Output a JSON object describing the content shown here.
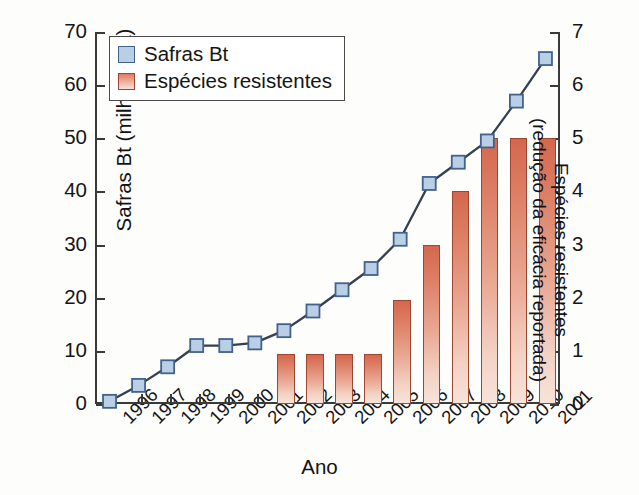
{
  "chart_data": {
    "type": "bar",
    "title": "",
    "xlabel": "Ano",
    "categories": [
      "1996",
      "1997",
      "1998",
      "1999",
      "2000",
      "2001",
      "2002",
      "2003",
      "2004",
      "2005",
      "2006",
      "2007",
      "2008",
      "2009",
      "2010",
      "2011"
    ],
    "series": [
      {
        "name": "Safras Bt",
        "type": "line",
        "axis": "left",
        "ylabel": "Safras Bt (milhões/ha)",
        "ylim": [
          0,
          70
        ],
        "yticks": [
          0,
          10,
          20,
          30,
          40,
          50,
          60,
          70
        ],
        "marker": "square",
        "color": "#b9cfe6",
        "values": [
          0.5,
          3.5,
          7.0,
          11.0,
          11.0,
          11.5,
          13.8,
          17.5,
          21.5,
          25.5,
          31.0,
          41.5,
          45.5,
          49.5,
          57.0,
          65.0
        ]
      },
      {
        "name": "Espécies resistentes",
        "type": "bar",
        "axis": "right",
        "ylabel": "Espécies resistentes (redução da eficácia reportada)",
        "ylim": [
          0,
          7
        ],
        "yticks": [
          0,
          1,
          2,
          3,
          4,
          5,
          6,
          7
        ],
        "color": "#d4674e",
        "values": [
          0,
          0,
          0,
          0,
          0,
          0,
          0.95,
          0.95,
          0.95,
          0.95,
          1.95,
          3.0,
          4.0,
          5.0,
          5.0,
          5.0
        ]
      }
    ],
    "grid": false,
    "legend_position": "upper-left-inside"
  },
  "axes": {
    "left": {
      "title": "Safras Bt (milhões/ha)",
      "ticks": [
        "0",
        "10",
        "20",
        "30",
        "40",
        "50",
        "60",
        "70"
      ]
    },
    "right": {
      "title_line1": "Espécies resistentes",
      "title_line2": "(redução da eficácia reportada)",
      "ticks": [
        "0",
        "1",
        "2",
        "3",
        "4",
        "5",
        "6",
        "7"
      ]
    },
    "bottom": {
      "title": "Ano",
      "ticks": [
        "1996",
        "1997",
        "1998",
        "1999",
        "2000",
        "2001",
        "2002",
        "2003",
        "2004",
        "2005",
        "2006",
        "2007",
        "2008",
        "2009",
        "2010",
        "2011"
      ]
    }
  },
  "legend": {
    "items": [
      {
        "label": "Safras Bt",
        "swatch": "blue-square-marker"
      },
      {
        "label": "Espécies resistentes",
        "swatch": "red-gradient-bar"
      }
    ]
  },
  "colors": {
    "line": "#33404f",
    "marker_fill": "#b9cfe6",
    "marker_stroke": "#44618a",
    "bar_top": "#d4674e",
    "bar_bottom": "#f7e3d9",
    "bar_stroke": "#9d4733",
    "axis": "#3a3a3a",
    "background": "#fdfdfc"
  }
}
